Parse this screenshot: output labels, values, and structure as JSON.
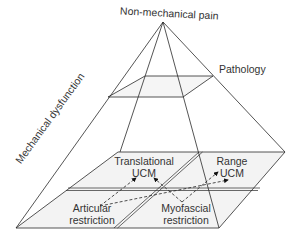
{
  "diagram": {
    "type": "pyramid",
    "apex_label": "Non-mechanical pain",
    "middle_label": "Pathology",
    "side_label": "Mechanical dysfunction",
    "base_quadrants": [
      {
        "id": "translational-ucm",
        "line1": "Translational",
        "line2": "UCM"
      },
      {
        "id": "range-ucm",
        "line1": "Range",
        "line2": "UCM"
      },
      {
        "id": "articular-restriction",
        "line1": "Articular",
        "line2": "restriction"
      },
      {
        "id": "myofascial-restriction",
        "line1": "Myofascial",
        "line2": "restriction"
      }
    ],
    "arrows": [
      {
        "from": "Articular restriction",
        "to": "Translational UCM",
        "style": "dashed"
      },
      {
        "from": "Articular restriction",
        "to": "Range UCM",
        "style": "dashed"
      },
      {
        "from": "Myofascial restriction",
        "to": "Translational UCM",
        "style": "dashed"
      },
      {
        "from": "Myofascial restriction",
        "to": "Range UCM",
        "style": "dashed"
      }
    ],
    "colors": {
      "line": "#2a2a2a",
      "plane_fill": "#f2f2f2",
      "text": "#333333"
    }
  }
}
